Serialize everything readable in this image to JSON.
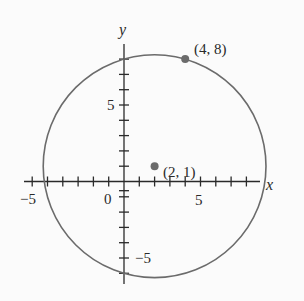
{
  "figure": {
    "x_axis_label": "x",
    "y_axis_label": "y",
    "origin_label": "0",
    "x_tick_labels": [
      {
        "value": -5,
        "text": "−5"
      },
      {
        "value": 5,
        "text": "5"
      }
    ],
    "y_tick_labels": [
      {
        "value": 5,
        "text": "5"
      },
      {
        "value": -5,
        "text": "−5"
      }
    ],
    "x_range": [
      -6,
      9
    ],
    "y_range": [
      -6,
      9
    ],
    "circle": {
      "center": [
        2,
        1
      ],
      "radius_squared": 53
    },
    "points": [
      {
        "x": 4,
        "y": 8,
        "label": "(4, 8)"
      },
      {
        "x": 2,
        "y": 1,
        "label": "(2, 1)"
      }
    ],
    "colors": {
      "circle": "#6b6b6b",
      "axes": "#2a2a2a",
      "points": "#6b6b6b"
    }
  }
}
